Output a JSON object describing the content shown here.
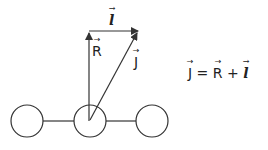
{
  "diagram": {
    "labels": {
      "l_vector": "l",
      "r_vector": "R",
      "j_vector": "J"
    },
    "equation": {
      "lhs": "J",
      "equals": "=",
      "term1": "R",
      "plus": "+",
      "term2": "l"
    },
    "nodes": [
      {
        "name": "left-atom",
        "cx": 27,
        "cy": 121,
        "r": 16
      },
      {
        "name": "center-atom",
        "cx": 90,
        "cy": 121,
        "r": 16
      },
      {
        "name": "right-atom",
        "cx": 152,
        "cy": 121,
        "r": 16
      }
    ],
    "colors": {
      "stroke": "#333333",
      "background": "#ffffff"
    }
  }
}
